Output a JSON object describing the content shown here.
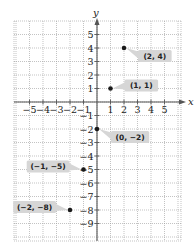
{
  "chart_data": {
    "type": "scatter",
    "title": "",
    "xlabel": "x",
    "ylabel": "y",
    "xlim": [
      -6,
      6
    ],
    "ylim": [
      -10,
      6
    ],
    "grid": true,
    "x_ticks": [
      -5,
      -4,
      -3,
      -2,
      -1,
      1,
      2,
      3,
      4,
      5
    ],
    "x_tick_labels": [
      "−5",
      "−4",
      "−3",
      "−2",
      "−1",
      "1",
      "2",
      "3",
      "4",
      "5"
    ],
    "y_ticks": [
      5,
      4,
      3,
      2,
      1,
      -1,
      -2,
      -3,
      -4,
      -5,
      -6,
      -7,
      -8,
      -9
    ],
    "y_tick_labels": [
      "5",
      "4",
      "3",
      "2",
      "1",
      "−1",
      "−2",
      "−3",
      "−4",
      "−5",
      "−6",
      "−7",
      "−8",
      "−9"
    ],
    "points": [
      {
        "x": 2,
        "y": 4,
        "label": "(2, 4)",
        "label_side": "right"
      },
      {
        "x": 1,
        "y": 1,
        "label": "(1, 1)",
        "label_side": "right"
      },
      {
        "x": 0,
        "y": -2,
        "label": "(0, −2)",
        "label_side": "right"
      },
      {
        "x": -1,
        "y": -5,
        "label": "(−1, −5)",
        "label_side": "left"
      },
      {
        "x": -2,
        "y": -8,
        "label": "(−2, −8)",
        "label_side": "left"
      }
    ]
  },
  "colors": {
    "grid": "#9a9a9a",
    "axis": "#555555",
    "point": "#1a1a1a",
    "label_bg": "#d6d6d6",
    "text": "#222222"
  }
}
